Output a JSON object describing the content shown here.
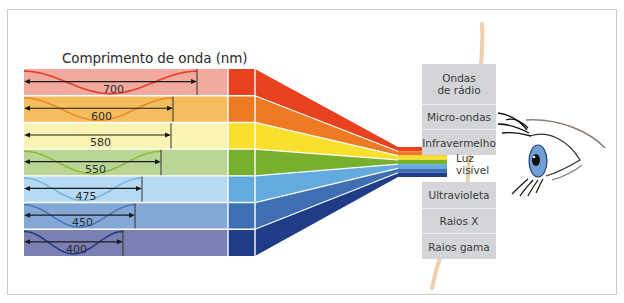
{
  "diagram": {
    "title": "Comprimento de onda (nm)",
    "bands": [
      {
        "wavelength": "700",
        "light": "#f2a99e",
        "mid": "#e8411f",
        "wave": "#e2412a",
        "arrow_end": 197
      },
      {
        "wavelength": "600",
        "light": "#f4bd5e",
        "mid": "#ef7a24",
        "wave": "#ec8a2a",
        "arrow_end": 173
      },
      {
        "wavelength": "580",
        "light": "#f9f3b4",
        "mid": "#f9e02c",
        "wave": "none",
        "arrow_end": 171
      },
      {
        "wavelength": "550",
        "light": "#bad595",
        "mid": "#78b02e",
        "wave": "#8fbb3a",
        "arrow_end": 161
      },
      {
        "wavelength": "475",
        "light": "#b6daf1",
        "mid": "#63aadf",
        "wave": "#7bb7e2",
        "arrow_end": 142
      },
      {
        "wavelength": "450",
        "light": "#84a8d6",
        "mid": "#3f6fb3",
        "wave": "#4a78bc",
        "arrow_end": 135
      },
      {
        "wavelength": "400",
        "light": "#7a80b2",
        "mid": "#1f3d86",
        "wave": "#263c8c",
        "arrow_end": 123
      }
    ],
    "spectrum_above": [
      "Ondas de rádio",
      "Micro-ondas",
      "Infravermelho"
    ],
    "visible_label_line1": "Luz",
    "visible_label_line2": "visível",
    "spectrum_below": [
      "Ultravioleta",
      "Raios X",
      "Raios gama"
    ],
    "eye": "eye-illustration",
    "colors": {
      "frame_border": "#c8cccc",
      "box_bg": "#d3d5d8",
      "eye_iris": "#6f9fd6",
      "beam": "#efcfa9"
    }
  }
}
